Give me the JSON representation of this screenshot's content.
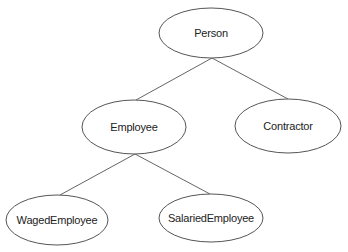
{
  "diagram": {
    "type": "inheritance-tree",
    "nodes": [
      {
        "id": "person",
        "label": "Person",
        "cx": 211,
        "cy": 33,
        "rx": 52,
        "ry": 25
      },
      {
        "id": "employee",
        "label": "Employee",
        "cx": 134,
        "cy": 127,
        "rx": 52,
        "ry": 27
      },
      {
        "id": "contractor",
        "label": "Contractor",
        "cx": 288,
        "cy": 126,
        "rx": 53,
        "ry": 27
      },
      {
        "id": "waged-employee",
        "label": "WagedEmployee",
        "cx": 57,
        "cy": 220,
        "rx": 51,
        "ry": 25
      },
      {
        "id": "salaried-employee",
        "label": "SalariedEmployee",
        "cx": 211,
        "cy": 218,
        "rx": 52,
        "ry": 24
      }
    ],
    "edges": [
      {
        "from": "person",
        "to": "employee",
        "x1": 212,
        "y1": 58,
        "x2": 136,
        "y2": 100
      },
      {
        "from": "person",
        "to": "contractor",
        "x1": 212,
        "y1": 58,
        "x2": 288,
        "y2": 99
      },
      {
        "from": "employee",
        "to": "waged-employee",
        "x1": 135,
        "y1": 154,
        "x2": 60,
        "y2": 195
      },
      {
        "from": "employee",
        "to": "salaried-employee",
        "x1": 135,
        "y1": 154,
        "x2": 210,
        "y2": 194
      }
    ],
    "colors": {
      "stroke": "#555555",
      "edge": "#666666",
      "text": "#222222",
      "background": "#ffffff"
    }
  }
}
